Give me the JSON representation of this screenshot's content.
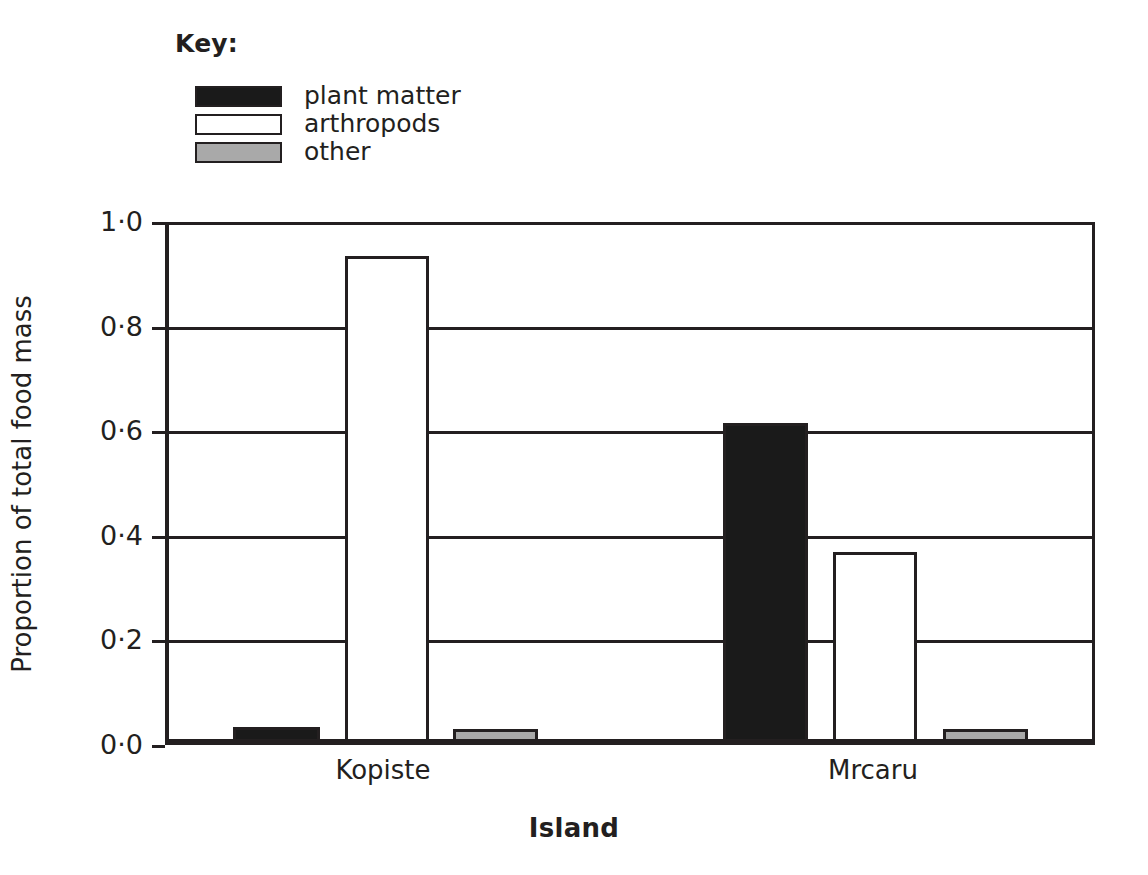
{
  "legend": {
    "title": "Key:",
    "entries": [
      {
        "label": "plant matter",
        "swatch": "black-filled-swatch",
        "color": "#1a1a1a"
      },
      {
        "label": "arthropods",
        "swatch": "white-filled-swatch",
        "color": "#ffffff"
      },
      {
        "label": "other",
        "swatch": "grey-filled-swatch",
        "color": "#a9a9a9"
      }
    ]
  },
  "chart_data": {
    "type": "bar",
    "title": "",
    "xlabel": "Island",
    "ylabel": "Proportion of total food mass",
    "categories": [
      "Kopiste",
      "Mrcaru"
    ],
    "series": [
      {
        "name": "plant matter",
        "values": [
          0.035,
          0.615
        ],
        "color": "#1a1a1a"
      },
      {
        "name": "arthropods",
        "values": [
          0.935,
          0.37
        ],
        "color": "#ffffff"
      },
      {
        "name": "other",
        "values": [
          0.03,
          0.03
        ],
        "color": "#a9a9a9"
      }
    ],
    "ylim": [
      0.0,
      1.0
    ],
    "yticks": [
      0.0,
      0.2,
      0.4,
      0.6,
      0.8,
      1.0
    ],
    "ytick_labels": [
      "0·0",
      "0·2",
      "0·4",
      "0·6",
      "0·8",
      "1·0"
    ],
    "grid": true,
    "legend_position": "above-plot-left"
  }
}
